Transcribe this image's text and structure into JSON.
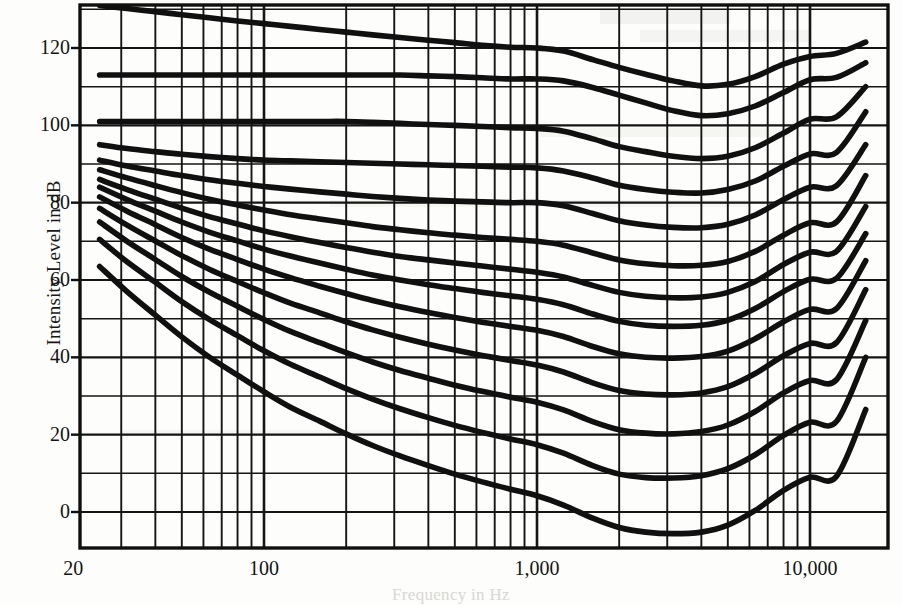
{
  "figure": {
    "kind": "equal-loudness-contours",
    "background_color": "#fdfdfb",
    "ink_color": "#101010"
  },
  "axes": {
    "y_axis_title": "Intensity Level in dB",
    "x_axis_title": "Frequency in Hz",
    "y_ticks": [
      {
        "label": "120",
        "value": 120
      },
      {
        "label": "100",
        "value": 100
      },
      {
        "label": "80",
        "value": 80
      },
      {
        "label": "60",
        "value": 60
      },
      {
        "label": "40",
        "value": 40
      },
      {
        "label": "20",
        "value": 20
      },
      {
        "label": "0",
        "value": 0
      }
    ],
    "x_ticks": [
      {
        "label": "20",
        "value": 20
      },
      {
        "label": "100",
        "value": 100
      },
      {
        "label": "1,000",
        "value": 1000
      },
      {
        "label": "10,000",
        "value": 10000
      }
    ]
  },
  "chart_data": {
    "type": "line",
    "title": "",
    "subtitle": "",
    "xlabel": "Frequency in Hz",
    "ylabel": "Intensity Level in dB",
    "xscale": "log",
    "yscale": "linear",
    "xlim": [
      20,
      17000
    ],
    "ylim": [
      -9.5,
      131
    ],
    "grid": true,
    "grid_style": "log-decade minor lines on x, 10 dB lines on y",
    "legend": "none",
    "x": [
      25,
      31.5,
      40,
      50,
      63,
      80,
      100,
      125,
      160,
      200,
      250,
      315,
      400,
      500,
      630,
      800,
      1000,
      1250,
      1600,
      2000,
      2500,
      3150,
      4000,
      5000,
      6300,
      8000,
      10000,
      12500,
      16000
    ],
    "series": [
      {
        "name": "130 phon",
        "values": [
          131,
          130.2,
          129.4,
          128.6,
          127.8,
          127.0,
          126.3,
          125.6,
          124.8,
          124.1,
          123.4,
          122.7,
          122.0,
          121.4,
          120.7,
          120.2,
          120.0,
          119.2,
          117.0,
          115.0,
          113.2,
          111.5,
          110.2,
          110.6,
          112.6,
          115.8,
          117.8,
          118.6,
          121.5
        ]
      },
      {
        "name": "120 phon",
        "values": [
          113.0,
          113.0,
          113.0,
          113.0,
          113.0,
          113.0,
          113.0,
          113.0,
          113.0,
          113.0,
          113.0,
          113.0,
          112.8,
          112.6,
          112.3,
          112.0,
          112.0,
          111.5,
          109.8,
          107.8,
          105.8,
          103.8,
          102.5,
          103.0,
          105.0,
          108.5,
          111.8,
          112.4,
          116.2
        ]
      },
      {
        "name": "110 phon",
        "values": [
          101.0,
          101.0,
          101.0,
          101.0,
          101.0,
          101.0,
          101.0,
          101.0,
          101.0,
          101.0,
          100.8,
          100.5,
          100.2,
          100.0,
          99.7,
          99.4,
          99.2,
          98.5,
          96.5,
          94.5,
          93.2,
          92.0,
          91.4,
          92.0,
          94.2,
          98.0,
          101.6,
          102.2,
          110.0
        ]
      },
      {
        "name": "100 phon",
        "values": [
          95.0,
          94.0,
          93.2,
          92.5,
          91.9,
          91.4,
          91.0,
          90.8,
          90.6,
          90.4,
          90.2,
          90.0,
          89.8,
          89.6,
          89.4,
          89.2,
          89.0,
          88.2,
          86.4,
          84.5,
          83.4,
          82.7,
          82.5,
          83.4,
          85.6,
          89.4,
          92.6,
          93.0,
          103.5
        ]
      },
      {
        "name": "90 phon",
        "values": [
          91.0,
          89.5,
          88.2,
          87.0,
          85.9,
          85.0,
          84.2,
          83.5,
          82.8,
          82.2,
          81.6,
          81.1,
          80.7,
          80.4,
          80.2,
          80.0,
          80.0,
          79.2,
          77.2,
          75.3,
          74.2,
          73.6,
          73.5,
          74.4,
          76.8,
          80.8,
          84.0,
          84.4,
          95.0
        ]
      },
      {
        "name": "80 phon",
        "values": [
          88.5,
          86.4,
          84.4,
          82.6,
          80.9,
          79.4,
          78.1,
          76.9,
          75.8,
          74.8,
          73.8,
          73.0,
          72.2,
          71.6,
          71.0,
          70.5,
          70.0,
          69.0,
          67.0,
          65.2,
          64.2,
          63.7,
          63.8,
          64.8,
          67.4,
          71.6,
          74.8,
          75.0,
          87.0
        ]
      },
      {
        "name": "70 phon",
        "values": [
          86.0,
          83.4,
          80.9,
          78.6,
          76.4,
          74.5,
          72.7,
          71.2,
          69.7,
          68.4,
          67.2,
          66.1,
          65.2,
          64.4,
          63.6,
          62.8,
          62.0,
          60.8,
          58.6,
          56.8,
          55.8,
          55.4,
          55.6,
          56.8,
          59.6,
          64.0,
          67.2,
          67.4,
          79.0
        ]
      },
      {
        "name": "60 phon",
        "values": [
          84.0,
          80.8,
          77.8,
          75.0,
          72.4,
          70.1,
          68.0,
          66.2,
          64.4,
          62.8,
          61.3,
          60.0,
          58.8,
          57.8,
          56.8,
          55.9,
          55.0,
          53.6,
          51.2,
          49.3,
          48.3,
          48.0,
          48.3,
          49.6,
          52.6,
          57.0,
          60.2,
          60.4,
          72.0
        ]
      },
      {
        "name": "50 phon",
        "values": [
          81.5,
          77.8,
          74.3,
          71.0,
          68.0,
          65.3,
          62.8,
          60.6,
          58.4,
          56.5,
          54.7,
          53.1,
          51.6,
          50.3,
          49.1,
          48.0,
          47.0,
          45.4,
          42.8,
          40.9,
          40.0,
          39.8,
          40.2,
          41.6,
          44.8,
          49.2,
          52.4,
          52.6,
          65.0
        ]
      },
      {
        "name": "40 phon",
        "values": [
          78.5,
          74.2,
          70.1,
          66.3,
          62.8,
          59.6,
          56.7,
          54.0,
          51.5,
          49.2,
          47.1,
          45.2,
          43.4,
          41.9,
          40.5,
          39.2,
          38.0,
          36.2,
          33.4,
          31.4,
          30.5,
          30.3,
          30.8,
          32.4,
          35.8,
          40.4,
          43.6,
          43.8,
          57.5
        ]
      },
      {
        "name": "30 phon",
        "values": [
          75.0,
          70.0,
          65.3,
          60.9,
          56.9,
          53.2,
          49.8,
          46.7,
          43.8,
          41.2,
          38.8,
          36.6,
          34.6,
          32.8,
          31.2,
          29.7,
          28.4,
          26.4,
          23.4,
          21.3,
          20.4,
          20.2,
          20.8,
          22.5,
          26.0,
          30.8,
          34.0,
          34.2,
          49.5
        ]
      },
      {
        "name": "20 phon",
        "values": [
          70.5,
          64.7,
          59.4,
          54.4,
          49.8,
          45.6,
          41.7,
          38.2,
          34.9,
          31.9,
          29.2,
          26.7,
          24.4,
          22.4,
          20.6,
          18.9,
          17.4,
          15.2,
          12.0,
          9.8,
          8.9,
          8.8,
          9.4,
          11.2,
          14.8,
          19.8,
          23.2,
          23.4,
          40.0
        ]
      },
      {
        "name": "10 phon (threshold)",
        "values": [
          63.5,
          57.0,
          50.9,
          45.3,
          40.1,
          35.4,
          31.1,
          27.1,
          23.5,
          20.2,
          17.2,
          14.5,
          12.0,
          9.8,
          7.8,
          5.9,
          4.2,
          1.8,
          -1.6,
          -4.0,
          -5.2,
          -5.6,
          -5.2,
          -3.4,
          0.4,
          5.6,
          9.0,
          9.2,
          26.5
        ]
      }
    ]
  }
}
